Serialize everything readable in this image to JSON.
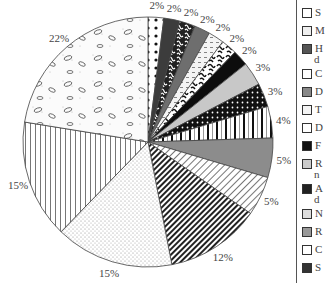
{
  "chart_data": {
    "type": "pie",
    "title": "",
    "start_angle_deg": 0,
    "direction": "clockwise",
    "slices": [
      {
        "label": "S…",
        "value": 2,
        "pattern": "dots-on-white",
        "color": "#ffffff"
      },
      {
        "label": "M…",
        "value": 2,
        "pattern": "dark-gray-solid",
        "color": "#3c3c3c"
      },
      {
        "label": "H… d…",
        "value": 2,
        "pattern": "black-white-squiggle",
        "color": "#222222"
      },
      {
        "label": "C…",
        "value": 2,
        "pattern": "medium-gray-solid",
        "color": "#6e6e6e"
      },
      {
        "label": "D…",
        "value": 2,
        "pattern": "light-dashes",
        "color": "#f2f2f2"
      },
      {
        "label": "T…",
        "value": 2,
        "pattern": "black-squiggle-white",
        "color": "#ffffff"
      },
      {
        "label": "D…",
        "value": 2,
        "pattern": "black-solid",
        "color": "#0d0d0d"
      },
      {
        "label": "F…",
        "value": 3,
        "pattern": "light-gray-solid",
        "color": "#c8c8c8"
      },
      {
        "label": "R… n…",
        "value": 3,
        "pattern": "black-white-dots",
        "color": "#111111"
      },
      {
        "label": "A… d…",
        "value": 4,
        "pattern": "vertical-bars",
        "color": "#ffffff"
      },
      {
        "label": "N…",
        "value": 5,
        "pattern": "gray-solid",
        "color": "#8c8c8c"
      },
      {
        "label": "R…",
        "value": 5,
        "pattern": "light-diagonal",
        "color": "#ffffff"
      },
      {
        "label": "C…",
        "value": 12,
        "pattern": "dark-diagonal",
        "color": "#333333"
      },
      {
        "label": "S…",
        "value": 15,
        "pattern": "stipple",
        "color": "#eeeeee"
      },
      {
        "label": "",
        "value": 15,
        "pattern": "vertical-lines",
        "color": "#ffffff"
      },
      {
        "label": "",
        "value": 22,
        "pattern": "ovals-stipple",
        "color": "#f6f6f6"
      }
    ],
    "value_labels": [
      "2%",
      "2%",
      "2%",
      "2%",
      "2%",
      "2%",
      "2%",
      "3%",
      "3%",
      "4%",
      "5%",
      "5%",
      "12%",
      "15%",
      "15%",
      "22%"
    ],
    "legend_position": "right",
    "legend_entries": [
      {
        "text": "S",
        "swatch": "white"
      },
      {
        "text": "M",
        "swatch": "dots"
      },
      {
        "text": "H",
        "text2": "d",
        "swatch": "dark-gray"
      },
      {
        "text": "C",
        "swatch": "squiggle"
      },
      {
        "text": "D",
        "swatch": "gray"
      },
      {
        "text": "T",
        "swatch": "dashes"
      },
      {
        "text": "D",
        "swatch": "squiggle-white"
      },
      {
        "text": "F",
        "swatch": "black"
      },
      {
        "text": "R",
        "text2": "n",
        "swatch": "light-gray"
      },
      {
        "text": "A",
        "text2": "d",
        "swatch": "black-dots"
      },
      {
        "text": "N",
        "swatch": "vertical-bars"
      },
      {
        "text": "R",
        "swatch": "gray-solid"
      },
      {
        "text": "C",
        "swatch": "light-diagonal"
      },
      {
        "text": "S",
        "swatch": "dark-diagonal"
      }
    ],
    "grid": false
  }
}
